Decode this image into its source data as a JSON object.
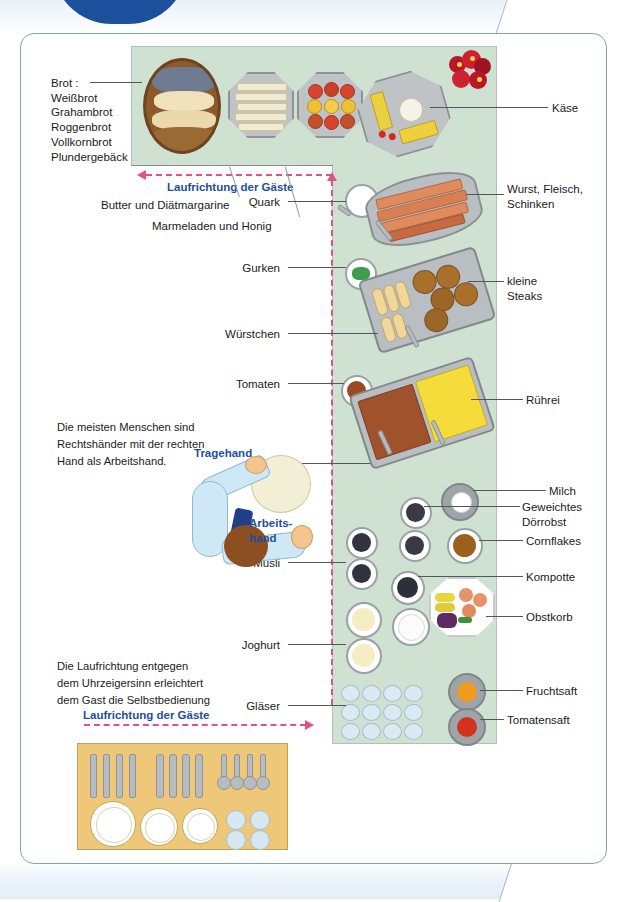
{
  "colors": {
    "table_green": "#cfe2d2",
    "path_pink": "#e0518b",
    "label_blue": "#1d4f9e",
    "frame_blue": "#7fa3c8",
    "setting_wood": "#eec878"
  },
  "left_labels": [
    {
      "name": "bread-label",
      "text": "Brot :\nWeißbrot\nGrahambrot\nRoggenbrot\nVollkornbrot\nPlundergebäck"
    },
    {
      "name": "butter-label",
      "text": "Butter und Diätmargarine"
    },
    {
      "name": "jam-label",
      "text": "Marmeladen und Honig"
    },
    {
      "name": "quark-label",
      "text": "Quark"
    },
    {
      "name": "gurken-label",
      "text": "Gurken"
    },
    {
      "name": "wuerstchen-label",
      "text": "Würstchen"
    },
    {
      "name": "tomaten-label",
      "text": "Tomaten"
    },
    {
      "name": "speck-label",
      "text": "Speck"
    },
    {
      "name": "muesli-label",
      "text": "Müsli"
    },
    {
      "name": "joghurt-label",
      "text": "Joghurt"
    },
    {
      "name": "glaeser-label",
      "text": "Gläser"
    }
  ],
  "right_labels": [
    {
      "name": "kaese-label",
      "text": "Käse"
    },
    {
      "name": "wurst-label",
      "text": "Wurst, Fleisch,\nSchinken"
    },
    {
      "name": "steaks-label",
      "text": "kleine\nSteaks"
    },
    {
      "name": "ruehrei-label",
      "text": "Rührei"
    },
    {
      "name": "milch-label",
      "text": "Milch"
    },
    {
      "name": "doerrobst-label",
      "text": "Geweichtes\nDörrobst"
    },
    {
      "name": "cornflakes-label",
      "text": "Cornflakes"
    },
    {
      "name": "kompotte-label",
      "text": "Kompotte"
    },
    {
      "name": "obstkorb-label",
      "text": "Obstkorb"
    },
    {
      "name": "fruchtsaft-label",
      "text": "Fruchtsaft"
    },
    {
      "name": "tomatensaft-label",
      "text": "Tomatensaft"
    }
  ],
  "callouts": {
    "direction_top": "Laufrichtung der Gäste",
    "direction_bottom": "Laufrichtung der Gäste",
    "carry_hand": "Tragehand",
    "work_hand": "Arbeits-\nhand"
  },
  "notes": {
    "handedness": "Die meisten Menschen sind\nRechtshänder mit der rechten\nHand als Arbeitshand.",
    "counterclockwise": "Die Laufrichtung entgegen\ndem Uhrzeigersinn erleichtert\ndem Gast die Selbstbedienung"
  }
}
